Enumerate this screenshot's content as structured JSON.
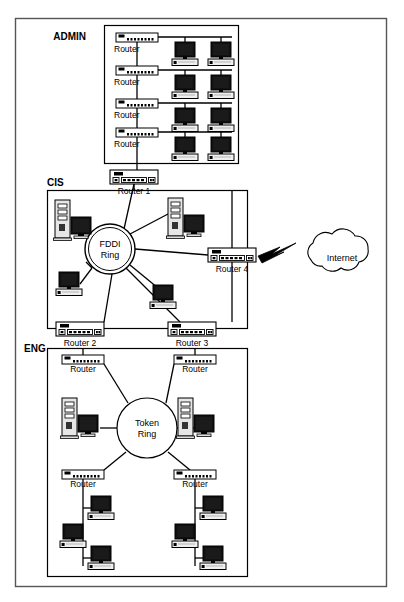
{
  "diagram": {
    "outer_frame": {
      "name": "outer-border"
    },
    "colors": {
      "line": "#000000",
      "background": "#ffffff",
      "screen": "#111111",
      "case": "#e8e8e8",
      "frame": "#555555"
    },
    "zones": [
      {
        "id": "admin",
        "label": "ADMIN",
        "label_x": 86,
        "label_y": 40,
        "box": {
          "x": 104,
          "y": 25,
          "w": 134,
          "h": 138
        }
      },
      {
        "id": "cis",
        "label": "CIS",
        "label_x": 36,
        "label_y": 186,
        "box": {
          "x": 47,
          "y": 190,
          "w": 200,
          "h": 138
        }
      },
      {
        "id": "eng",
        "label": "ENG",
        "label_x": 36,
        "label_y": 345,
        "box": {
          "x": 47,
          "y": 348,
          "w": 200,
          "h": 228
        }
      }
    ],
    "rings": [
      {
        "id": "fddi",
        "line1": "FDDI",
        "line2": "Ring",
        "cx": 110,
        "cy": 249,
        "r": 25
      },
      {
        "id": "token",
        "line1": "Token",
        "line2": "Ring",
        "cx": 147,
        "cy": 428,
        "r": 30
      }
    ],
    "cloud": {
      "id": "internet",
      "label": "Internet",
      "cx": 340,
      "cy": 257,
      "rx": 36,
      "ry": 19
    },
    "routers": [
      {
        "id": "admin-router-1",
        "label": "Router",
        "x": 116,
        "y": 33,
        "w": 42,
        "h": 9,
        "size": "small",
        "label_pos": "below-left"
      },
      {
        "id": "admin-router-2",
        "label": "Router",
        "x": 116,
        "y": 66,
        "w": 42,
        "h": 9,
        "size": "small",
        "label_pos": "below-left"
      },
      {
        "id": "admin-router-3",
        "label": "Router",
        "x": 116,
        "y": 99,
        "w": 42,
        "h": 9,
        "size": "small",
        "label_pos": "below-left"
      },
      {
        "id": "admin-router-4",
        "label": "Router",
        "x": 116,
        "y": 128,
        "w": 42,
        "h": 9,
        "size": "small",
        "label_pos": "below-left"
      },
      {
        "id": "router-1",
        "label": "Router 1",
        "x": 110,
        "y": 170,
        "w": 48,
        "h": 14,
        "size": "large",
        "label_pos": "below-center"
      },
      {
        "id": "router-2",
        "label": "Router 2",
        "x": 56,
        "y": 322,
        "w": 48,
        "h": 14,
        "size": "large",
        "label_pos": "below-center"
      },
      {
        "id": "router-3",
        "label": "Router 3",
        "x": 168,
        "y": 322,
        "w": 48,
        "h": 14,
        "size": "large",
        "label_pos": "below-center"
      },
      {
        "id": "router-4",
        "label": "Router 4",
        "x": 208,
        "y": 248,
        "w": 48,
        "h": 14,
        "size": "large",
        "label_pos": "below-center"
      },
      {
        "id": "eng-router-tl",
        "label": "Router",
        "x": 62,
        "y": 355,
        "w": 42,
        "h": 9,
        "size": "small",
        "label_pos": "below-center"
      },
      {
        "id": "eng-router-tr",
        "label": "Router",
        "x": 174,
        "y": 355,
        "w": 42,
        "h": 9,
        "size": "small",
        "label_pos": "below-center"
      },
      {
        "id": "eng-router-bl",
        "label": "Router",
        "x": 62,
        "y": 470,
        "w": 42,
        "h": 9,
        "size": "small",
        "label_pos": "below-center"
      },
      {
        "id": "eng-router-br",
        "label": "Router",
        "x": 174,
        "y": 470,
        "w": 42,
        "h": 9,
        "size": "small",
        "label_pos": "below-center"
      }
    ],
    "workstations": [
      {
        "id": "admin-pc-r1-a",
        "x": 172,
        "y": 42
      },
      {
        "id": "admin-pc-r1-b",
        "x": 208,
        "y": 42
      },
      {
        "id": "admin-pc-r2-a",
        "x": 172,
        "y": 75
      },
      {
        "id": "admin-pc-r2-b",
        "x": 208,
        "y": 75
      },
      {
        "id": "admin-pc-r3-a",
        "x": 172,
        "y": 108
      },
      {
        "id": "admin-pc-r3-b",
        "x": 208,
        "y": 108
      },
      {
        "id": "admin-pc-r4-a",
        "x": 172,
        "y": 137
      },
      {
        "id": "admin-pc-r4-b",
        "x": 208,
        "y": 137
      },
      {
        "id": "cis-pc-left",
        "x": 56,
        "y": 272
      },
      {
        "id": "cis-pc-right",
        "x": 150,
        "y": 285
      },
      {
        "id": "eng-pc-1",
        "x": 88,
        "y": 496
      },
      {
        "id": "eng-pc-2",
        "x": 60,
        "y": 524
      },
      {
        "id": "eng-pc-3",
        "x": 88,
        "y": 546
      },
      {
        "id": "eng-pc-4",
        "x": 200,
        "y": 496
      },
      {
        "id": "eng-pc-5",
        "x": 172,
        "y": 524
      },
      {
        "id": "eng-pc-6",
        "x": 200,
        "y": 546
      }
    ],
    "servers": [
      {
        "id": "cis-server-left",
        "x": 55,
        "y": 200
      },
      {
        "id": "cis-server-right",
        "x": 168,
        "y": 198
      },
      {
        "id": "eng-server-left",
        "x": 62,
        "y": 398
      },
      {
        "id": "eng-server-right",
        "x": 178,
        "y": 398
      }
    ],
    "connector": {
      "id": "wan-lightning",
      "from": "router-4",
      "to": "internet"
    }
  }
}
